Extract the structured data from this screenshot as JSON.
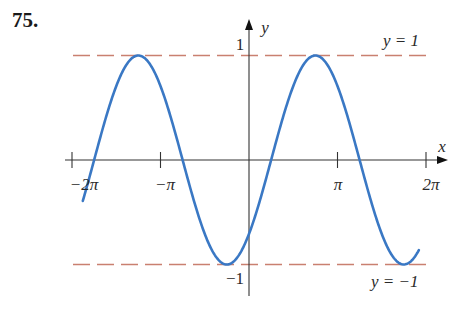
{
  "problem": {
    "number": "75."
  },
  "axes": {
    "x_label": "x",
    "y_label": "y",
    "x_ticks": [
      {
        "value": -6.283185,
        "label": "−2π"
      },
      {
        "value": -3.141593,
        "label": "−π"
      },
      {
        "value": 3.141593,
        "label": "π"
      },
      {
        "value": 6.283185,
        "label": "2π"
      }
    ],
    "y_ticks": [
      {
        "value": 1,
        "label": "1"
      },
      {
        "value": -1,
        "label": "−1"
      }
    ]
  },
  "asymptote_labels": {
    "upper": "y = 1",
    "lower": "y = −1"
  },
  "colors": {
    "curve": "#3a78c4",
    "dashed": "#c98070",
    "axis": "#333333"
  },
  "chart_data": {
    "type": "line",
    "title": "75.",
    "xlabel": "x",
    "ylabel": "y",
    "function": "y = sin(x - pi/4)",
    "xlim": [
      -6.5,
      7.0
    ],
    "ylim": [
      -1.3,
      1.35
    ],
    "x_domain_drawn": [
      -5.9,
      6.03
    ],
    "x_tick_labels": [
      "−2π",
      "−π",
      "π",
      "2π"
    ],
    "y_tick_labels": [
      "1",
      "−1"
    ],
    "reference_lines": [
      {
        "y": 1,
        "style": "dashed",
        "label": "y = 1"
      },
      {
        "y": -1,
        "style": "dashed",
        "label": "y = −1"
      }
    ],
    "key_points": {
      "maxima": [
        [
          -3.927,
          1
        ],
        [
          2.356,
          1
        ]
      ],
      "minima": [
        [
          -0.785,
          -1
        ],
        [
          5.498,
          -1
        ]
      ],
      "zeros": [
        [
          -5.498,
          0
        ],
        [
          -2.356,
          0
        ],
        [
          0.785,
          0
        ],
        [
          3.927,
          0
        ]
      ]
    },
    "x": [
      -5.9,
      -5.498,
      -4.712,
      -3.927,
      -3.142,
      -2.356,
      -1.571,
      -0.785,
      0,
      0.785,
      1.571,
      2.356,
      3.142,
      3.927,
      4.712,
      5.498,
      6.03
    ],
    "series": [
      {
        "name": "y = sin(x − π/4)",
        "values": [
          -0.37,
          0,
          0.707,
          1,
          0.707,
          0,
          -0.707,
          -1,
          -0.707,
          0,
          0.707,
          1,
          0.707,
          0,
          -0.707,
          -1,
          -0.85
        ]
      }
    ],
    "grid": false,
    "legend": "none"
  }
}
